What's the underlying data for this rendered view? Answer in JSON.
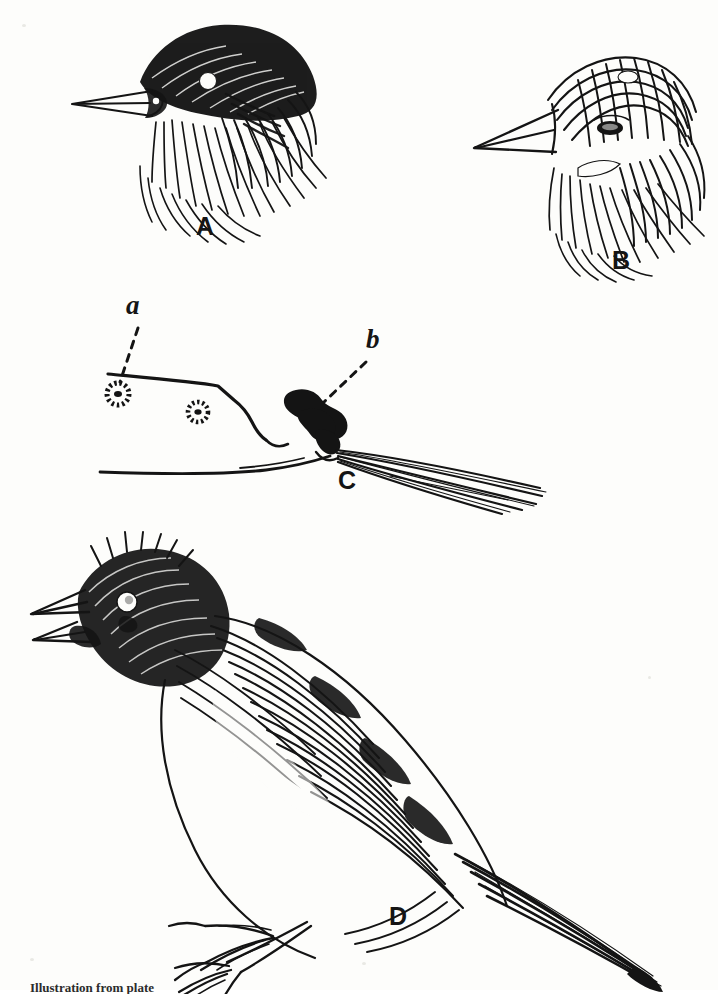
{
  "plate": {
    "kind": "scanned-book-plate",
    "medium": "pen-and-ink line drawing",
    "background_color": "#fdfdfb",
    "ink_color": "#141414",
    "subject": "sparrow / bunting studies"
  },
  "figures": [
    {
      "id": "A",
      "label": "A",
      "description": "Head and neck of bird facing left, solid black crown and nape, pale eye spot, shaggy throat feathering",
      "label_x": 196,
      "label_y": 214
    },
    {
      "id": "B",
      "label": "B",
      "description": "Head and neck of bird facing left, finely streaked crown and cheek, pale spot on crown and on malar area",
      "label_x": 612,
      "label_y": 248
    },
    {
      "id": "C",
      "label": "C",
      "description": "Outline profile of lower back, rump and tail base with vent region; two radiating follicle spots and a dark tufted mass",
      "label_x": 340,
      "label_y": 478
    },
    {
      "id": "D",
      "label": "D",
      "description": "Whole bird perched, head raised and bill open in song, streaked plumage, long tail, scaly legs and toes",
      "label_x": 390,
      "label_y": 908
    }
  ],
  "sub_labels": [
    {
      "id": "a",
      "label": "a",
      "belongs_to": "C",
      "points_to": "upper radiating follicle spot on the dorsal outline",
      "label_x": 126,
      "label_y": 300,
      "leader": {
        "x1": 138,
        "y1": 328,
        "x2": 118,
        "y2": 383
      }
    },
    {
      "id": "b",
      "label": "b",
      "belongs_to": "C",
      "points_to": "dark tangled tuft at base of tail",
      "label_x": 366,
      "label_y": 336,
      "leader": {
        "x1": 360,
        "y1": 362,
        "x2": 324,
        "y2": 401
      }
    }
  ],
  "caption": {
    "text": "Illustration from plate",
    "state": "cropped at page edge, only tops of letters visible"
  }
}
